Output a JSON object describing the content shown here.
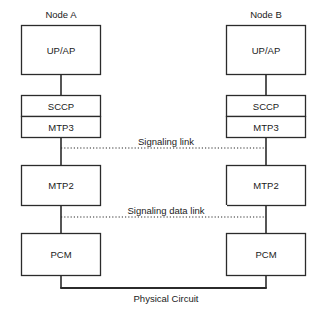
{
  "diagram": {
    "background_color": "#ffffff",
    "line_color": "#2b2b2b",
    "text_color": "#1a1a1a",
    "nodes": [
      {
        "id": "node-a",
        "title": "Node A",
        "layers": [
          {
            "id": "upap",
            "label": "UP/AP"
          },
          {
            "id": "sccp",
            "label": "SCCP"
          },
          {
            "id": "mtp3",
            "label": "MTP3"
          },
          {
            "id": "mtp2",
            "label": "MTP2"
          },
          {
            "id": "pcm",
            "label": "PCM"
          }
        ]
      },
      {
        "id": "node-b",
        "title": "Node B",
        "layers": [
          {
            "id": "upap",
            "label": "UP/AP"
          },
          {
            "id": "sccp",
            "label": "SCCP"
          },
          {
            "id": "mtp3",
            "label": "MTP3"
          },
          {
            "id": "mtp2",
            "label": "MTP2"
          },
          {
            "id": "pcm",
            "label": "PCM"
          }
        ]
      }
    ],
    "links": [
      {
        "id": "signaling-link",
        "label": "Signaling link",
        "style": "dotted"
      },
      {
        "id": "signaling-data-link",
        "label": "Signaling data link",
        "style": "dotted"
      },
      {
        "id": "physical-circuit",
        "label": "Physical Circuit",
        "style": "solid"
      }
    ]
  }
}
